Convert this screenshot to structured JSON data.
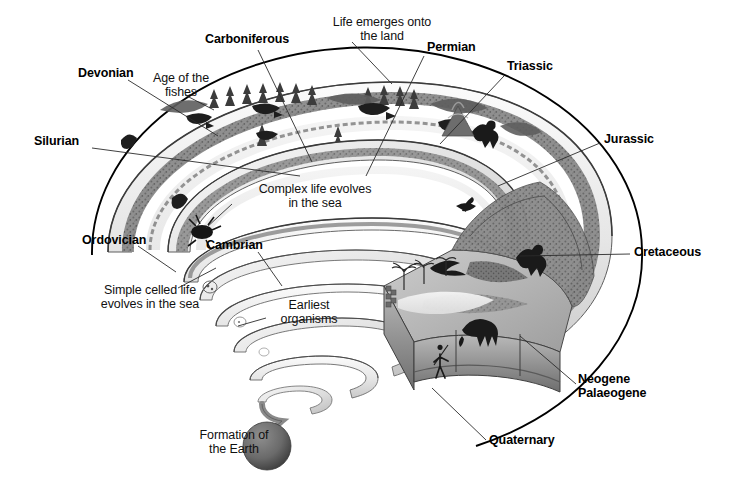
{
  "figure": {
    "background_color": "#ffffff",
    "ink_color": "#000000"
  },
  "palette": {
    "ramp_top_light": "#f2f2f2",
    "ramp_top_mid": "#d8d8d8",
    "ramp_edge_dark": "#6f6f6f",
    "ramp_edge_mid": "#9a9a9a",
    "terrain_rock": "#8d8d8d",
    "terrain_dark": "#5e5e5e",
    "sea_light": "#ececec",
    "earth_sphere": "#6b6b6b",
    "earth_sphere_shadow": "#4a4a4a",
    "outline": "#000000",
    "leader_line": "#333333"
  },
  "eras": [
    {
      "id": "silurian",
      "label": "Silurian",
      "style": "bold",
      "x": 34,
      "y": 141,
      "align": "left"
    },
    {
      "id": "devonian",
      "label": "Devonian",
      "style": "bold",
      "x": 78,
      "y": 73,
      "align": "left"
    },
    {
      "id": "carboniferous",
      "label": "Carboniferous",
      "style": "bold",
      "x": 205,
      "y": 39,
      "align": "left"
    },
    {
      "id": "permian",
      "label": "Permian",
      "style": "bold",
      "x": 427,
      "y": 47,
      "align": "left"
    },
    {
      "id": "triassic",
      "label": "Triassic",
      "style": "bold",
      "x": 507,
      "y": 66,
      "align": "left"
    },
    {
      "id": "jurassic",
      "label": "Jurassic",
      "style": "bold",
      "x": 604,
      "y": 139,
      "align": "left"
    },
    {
      "id": "cretaceous",
      "label": "Cretaceous",
      "style": "bold",
      "x": 634,
      "y": 252,
      "align": "left"
    },
    {
      "id": "neogene-palaeogene",
      "label": "Neogene\nPalaeogene",
      "style": "bold",
      "x": 578,
      "y": 379,
      "align": "left"
    },
    {
      "id": "quaternary",
      "label": "Quaternary",
      "style": "bold",
      "x": 489,
      "y": 440,
      "align": "left"
    },
    {
      "id": "ordovician",
      "label": "Ordovician",
      "style": "bold",
      "x": 82,
      "y": 240,
      "align": "left"
    },
    {
      "id": "cambrian",
      "label": "Cambrian",
      "style": "bold",
      "x": 206,
      "y": 245,
      "align": "left"
    }
  ],
  "annotations": [
    {
      "id": "life-emerges",
      "label": "Life emerges onto\nthe land",
      "x": 317,
      "y": 22,
      "align": "center",
      "width": 140
    },
    {
      "id": "age-of-fishes",
      "label": "Age of the\nfishes",
      "x": 143,
      "y": 78,
      "align": "center",
      "width": 86
    },
    {
      "id": "complex-life",
      "label": "Complex life evolves\nin the sea",
      "x": 240,
      "y": 189,
      "align": "center",
      "width": 160
    },
    {
      "id": "simple-celled",
      "label": "Simple celled life\nevolves in the sea",
      "x": 80,
      "y": 290,
      "align": "center",
      "width": 140
    },
    {
      "id": "earliest-organisms",
      "label": "Earliest\norganisms",
      "x": 268,
      "y": 305,
      "align": "center",
      "width": 92
    },
    {
      "id": "formation-earth",
      "label": "Formation of\nthe Earth",
      "x": 186,
      "y": 435,
      "align": "center",
      "width": 104
    }
  ],
  "scene_elements": {
    "earth_sphere": {
      "cx": 267,
      "cy": 446,
      "r": 24
    },
    "spiral_coils": 7,
    "cutaway_block": true,
    "organisms": [
      "conifer-trees",
      "amphibian",
      "early-fish",
      "trilobite",
      "dinosaur-theropod",
      "pterosaur",
      "mammoth",
      "human-figure",
      "volcano",
      "microorganism"
    ]
  }
}
